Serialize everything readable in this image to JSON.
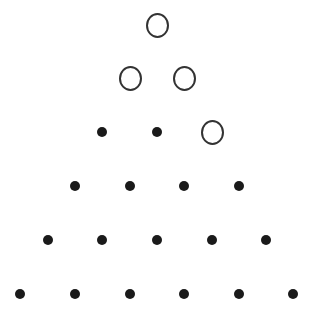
{
  "diagram": {
    "colors": {
      "dot": "#1a1a1a",
      "ring": "#333333",
      "background": "#ffffff"
    },
    "rows": [
      [
        {
          "x": 157,
          "y": 25,
          "type": "ring"
        }
      ],
      [
        {
          "x": 130,
          "y": 78,
          "type": "ring"
        },
        {
          "x": 184,
          "y": 78,
          "type": "ring"
        }
      ],
      [
        {
          "x": 102,
          "y": 132,
          "type": "dot"
        },
        {
          "x": 157,
          "y": 132,
          "type": "dot"
        },
        {
          "x": 212,
          "y": 132,
          "type": "ring"
        }
      ],
      [
        {
          "x": 75,
          "y": 186,
          "type": "dot"
        },
        {
          "x": 130,
          "y": 186,
          "type": "dot"
        },
        {
          "x": 184,
          "y": 186,
          "type": "dot"
        },
        {
          "x": 239,
          "y": 186,
          "type": "dot"
        }
      ],
      [
        {
          "x": 48,
          "y": 240,
          "type": "dot"
        },
        {
          "x": 102,
          "y": 240,
          "type": "dot"
        },
        {
          "x": 157,
          "y": 240,
          "type": "dot"
        },
        {
          "x": 212,
          "y": 240,
          "type": "dot"
        },
        {
          "x": 266,
          "y": 240,
          "type": "dot"
        }
      ],
      [
        {
          "x": 20,
          "y": 294,
          "type": "dot"
        },
        {
          "x": 75,
          "y": 294,
          "type": "dot"
        },
        {
          "x": 130,
          "y": 294,
          "type": "dot"
        },
        {
          "x": 184,
          "y": 294,
          "type": "dot"
        },
        {
          "x": 239,
          "y": 294,
          "type": "dot"
        },
        {
          "x": 293,
          "y": 294,
          "type": "dot"
        }
      ]
    ]
  }
}
